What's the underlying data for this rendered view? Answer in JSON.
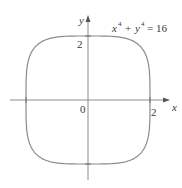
{
  "chart_data": {
    "type": "line",
    "title": "",
    "equation": "x⁴ + y⁴ = 16",
    "xlabel": "x",
    "ylabel": "y",
    "xlim": [
      -2.4,
      2.6
    ],
    "ylim": [
      -2.6,
      2.6
    ],
    "x_ticks": [
      {
        "value": 2,
        "label": "2"
      }
    ],
    "y_ticks": [
      {
        "value": 2,
        "label": "2"
      }
    ],
    "origin_label": "0",
    "grid": false,
    "legend": null,
    "series": [
      {
        "name": "x^4 + y^4 = 16",
        "description": "closed superellipse curve through (±2,0) and (0,±2)",
        "points": [
          [
            2,
            0
          ],
          [
            1.98,
            0.6
          ],
          [
            1.9,
            1.1
          ],
          [
            1.68,
            1.5
          ],
          [
            1.5,
            1.68
          ],
          [
            1.1,
            1.9
          ],
          [
            0.6,
            1.98
          ],
          [
            0,
            2
          ],
          [
            -0.6,
            1.98
          ],
          [
            -1.1,
            1.9
          ],
          [
            -1.5,
            1.68
          ],
          [
            -1.68,
            1.5
          ],
          [
            -1.9,
            1.1
          ],
          [
            -1.98,
            0.6
          ],
          [
            -2,
            0
          ],
          [
            -1.98,
            -0.6
          ],
          [
            -1.9,
            -1.1
          ],
          [
            -1.68,
            -1.5
          ],
          [
            -1.5,
            -1.68
          ],
          [
            -1.1,
            -1.9
          ],
          [
            -0.6,
            -1.98
          ],
          [
            0,
            -2
          ],
          [
            0.6,
            -1.98
          ],
          [
            1.1,
            -1.9
          ],
          [
            1.5,
            -1.68
          ],
          [
            1.68,
            -1.5
          ],
          [
            1.9,
            -1.1
          ],
          [
            1.98,
            -0.6
          ],
          [
            2,
            0
          ]
        ]
      }
    ]
  },
  "labels": {
    "equation_lhs_x": "x",
    "equation_exp1": "4",
    "equation_plus": "+",
    "equation_lhs_y": "y",
    "equation_exp2": "4",
    "equation_rhs": "= 16",
    "x_axis": "x",
    "y_axis": "y",
    "x_tick": "2",
    "y_tick": "2",
    "origin": "0"
  },
  "colors": {
    "curve": "#8a8a8a",
    "axes": "#7a7a7a",
    "text": "#3a3a3a"
  }
}
